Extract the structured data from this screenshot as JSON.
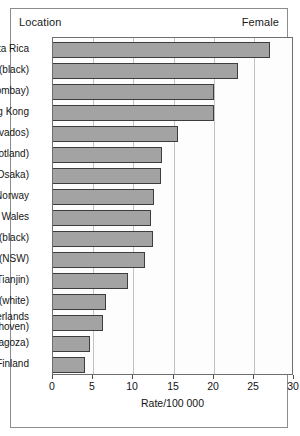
{
  "header": {
    "left_label": "Location",
    "right_label": "Female"
  },
  "chart_data": {
    "type": "bar",
    "orientation": "horizontal",
    "title": "",
    "xlabel": "Rate/100 000",
    "ylabel": "Location",
    "legend": "Female",
    "xlim": [
      0,
      30
    ],
    "xticks": [
      0,
      5,
      10,
      15,
      20,
      25,
      30
    ],
    "grid": "vertical",
    "categories": [
      "Costa Rica",
      "Bermuda (black)",
      "India (Bombay)",
      "Hong Kong",
      "France (Calvados)",
      "UK (Scotland)",
      "Japan (Osaka)",
      "Norway",
      "England and Wales",
      "USA (black)",
      "Australia (NSW)",
      "China (Tianjin)",
      "USA (white)",
      "Netherlands (Eindhoven)",
      "Spain (Zaragoza)",
      "Finland"
    ],
    "category_lines": [
      [
        "Costa Rica"
      ],
      [
        "Bermuda (black)"
      ],
      [
        "India (Bombay)"
      ],
      [
        "Hong Kong"
      ],
      [
        "France (Calvados)"
      ],
      [
        "UK (Scotland)"
      ],
      [
        "Japan (Osaka)"
      ],
      [
        "Norway"
      ],
      [
        "England and Wales"
      ],
      [
        "USA (black)"
      ],
      [
        "Australia (NSW)"
      ],
      [
        "China (Tianjin)"
      ],
      [
        "USA (white)"
      ],
      [
        "Netherlands",
        "(Eindhoven)"
      ],
      [
        "Spain (Zaragoza)"
      ],
      [
        "Finland"
      ]
    ],
    "values": [
      27.0,
      23.0,
      20.0,
      20.0,
      15.5,
      13.6,
      13.4,
      12.6,
      12.2,
      12.5,
      11.5,
      9.3,
      6.6,
      6.2,
      4.6,
      4.0
    ],
    "bar_color": "#a3a3a3",
    "bar_edge_color": "#3d3d3d",
    "grid_color": "#c2c2c2",
    "frame_color": "#8c8c8c"
  }
}
